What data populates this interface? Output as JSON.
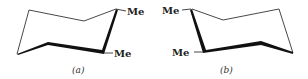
{
  "figure": {
    "panels": [
      {
        "id": "a",
        "caption": "(a)",
        "substituents": [
          {
            "label": "Me",
            "position": "top-right carbon"
          },
          {
            "label": "Me",
            "position": "front-right carbon"
          }
        ]
      },
      {
        "id": "b",
        "caption": "(b)",
        "substituents": [
          {
            "label": "Me",
            "position": "top-left carbon"
          },
          {
            "label": "Me",
            "position": "front-left carbon"
          }
        ]
      }
    ],
    "colors": {
      "line": "#222222",
      "background": "#ffffff"
    }
  }
}
